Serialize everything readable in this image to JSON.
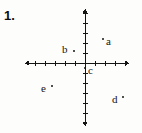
{
  "figure": {
    "problem_number": "1.",
    "type": "cartesian-coordinate-plane",
    "ink_color": "#141414",
    "background_color": "#fdfdfc"
  },
  "axes": {
    "origin": {
      "x": 85,
      "y": 63
    },
    "x_axis": {
      "name": "horizontal-axis",
      "start_x": 25,
      "end_x": 129,
      "y": 63,
      "arrow_left": true,
      "arrow_right": true,
      "tick_spacing": 10,
      "tick_length": 5,
      "ticks_left": 5,
      "ticks_right": 4
    },
    "y_axis": {
      "name": "vertical-axis",
      "start_y": 9,
      "end_y": 126,
      "x": 85,
      "arrow_up": true,
      "arrow_down": true,
      "tick_spacing": 10,
      "tick_length": 5,
      "ticks_up": 5,
      "ticks_down": 6
    }
  },
  "points": [
    {
      "label": "a",
      "name": "point-a",
      "dot_x": 103,
      "dot_y": 39,
      "label_x": 106,
      "label_y": 36,
      "quadrant": "I"
    },
    {
      "label": "b",
      "name": "point-b",
      "dot_x": 74,
      "dot_y": 51,
      "label_x": 62,
      "label_y": 44,
      "quadrant": "II"
    },
    {
      "label": "c",
      "name": "point-c",
      "dot_x": 85,
      "dot_y": 68,
      "label_x": 88,
      "label_y": 65,
      "quadrant": "on-y-axis-negative"
    },
    {
      "label": "d",
      "name": "point-d",
      "dot_x": 123,
      "dot_y": 97,
      "label_x": 112,
      "label_y": 94,
      "quadrant": "IV"
    },
    {
      "label": "e",
      "name": "point-e",
      "dot_x": 52,
      "dot_y": 86,
      "label_x": 41,
      "label_y": 83,
      "quadrant": "III"
    }
  ]
}
